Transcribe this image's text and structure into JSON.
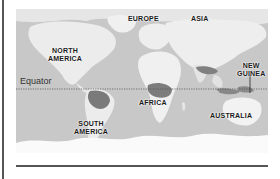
{
  "map": {
    "title": "World map with equator",
    "equator_label": "Equator",
    "continents": [
      {
        "id": "north-america",
        "line1": "NORTH",
        "line2": "AMERICA"
      },
      {
        "id": "europe",
        "line1": "EUROPE",
        "line2": ""
      },
      {
        "id": "asia",
        "line1": "ASIA",
        "line2": ""
      },
      {
        "id": "new-guinea",
        "line1": "NEW",
        "line2": "GUINEA"
      },
      {
        "id": "africa",
        "line1": "AFRICA",
        "line2": ""
      },
      {
        "id": "south-america",
        "line1": "SOUTH",
        "line2": "AMERICA"
      },
      {
        "id": "australia",
        "line1": "AUSTRALIA",
        "line2": ""
      }
    ],
    "colors": {
      "ocean": "#c9c9c9",
      "land": "#ececec",
      "rainforest": "#777777",
      "equator_line": "#555555",
      "rule": "#555555"
    }
  }
}
